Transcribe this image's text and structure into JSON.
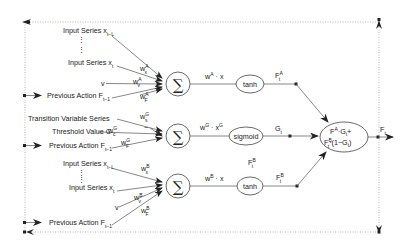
{
  "diagram": {
    "type": "gated neural network architecture",
    "block_A": {
      "inputs": [
        {
          "label": "Input Series x",
          "sub": "t−L"
        },
        {
          "label": "Input Series x",
          "sub": "t"
        },
        {
          "label": "v",
          "sub": ""
        },
        {
          "label": "Previous Action F",
          "sub": "t−1"
        }
      ],
      "weights": [
        {
          "base": "w",
          "sup": "A",
          "sub": "x"
        },
        {
          "base": "w",
          "sup": "A",
          "sub": "v"
        },
        {
          "base": "w",
          "sup": "A",
          "sub": "F"
        }
      ],
      "sum_symbol": "∑",
      "edge_label": {
        "base": "w",
        "sup": "A",
        "rest": " · x"
      },
      "activation": "tanh",
      "output": {
        "base": "F",
        "sup": "A",
        "sub": "t"
      }
    },
    "block_G": {
      "inputs": [
        {
          "label": "Transition Variable Series",
          "sub": ""
        },
        {
          "label": "Threshold Value C",
          "sub": ""
        },
        {
          "label": "Previous Action F",
          "sub": "t−1"
        }
      ],
      "weights": [
        {
          "base": "w",
          "sup": "G",
          "sub": "s"
        },
        {
          "base": "w",
          "sup": "G",
          "sub": "c"
        },
        {
          "base": "w",
          "sup": "G",
          "sub": "F"
        }
      ],
      "minus_sign": "−",
      "sum_symbol": "∑",
      "edge_label": {
        "base": "w",
        "sup": "G",
        "rest": " · x",
        "sup2": "G"
      },
      "activation": "sigmoid",
      "output": {
        "base": "G",
        "sub": "t"
      }
    },
    "block_B": {
      "inputs": [
        {
          "label": "Input Series x",
          "sub": "t−L"
        },
        {
          "label": "Input Series x",
          "sub": "t"
        },
        {
          "label": "v",
          "sub": ""
        },
        {
          "label": "Previous Action F",
          "sub": "t−1"
        }
      ],
      "weights": [
        {
          "base": "w",
          "sup": "B",
          "sub": "x"
        },
        {
          "base": "w",
          "sup": "B",
          "sub": "v"
        },
        {
          "base": "w",
          "sup": "B",
          "sub": "F"
        }
      ],
      "sum_symbol": "∑",
      "edge_label": {
        "base": "w",
        "sup": "B",
        "rest": " · x"
      },
      "activation": "tanh",
      "output": {
        "base": "F",
        "sup": "B",
        "sub": "t"
      },
      "extra_label": {
        "base": "F",
        "sup": "B",
        "sub": "t"
      }
    },
    "combiner": {
      "line1": {
        "a": "F",
        "a_sup": "A",
        "b": "·G",
        "b_sub": "t",
        "plus": "+"
      },
      "line2": {
        "a": "F",
        "a_sup": "B",
        "a_sub": "t",
        "rest": "·(1−G",
        "rest_sub": "t",
        "close": ")"
      }
    },
    "final_output": {
      "base": "F",
      "sub": "t"
    },
    "ellipsis": "⋮"
  }
}
